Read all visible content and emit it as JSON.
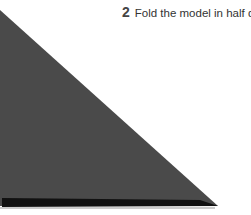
{
  "instruction": {
    "step_number": "2",
    "text": "Fold the model in half diagonally."
  },
  "diagram": {
    "shape": "folded-triangle",
    "paper_color": "#4a4a4a",
    "fold_edge_color": "#111111"
  }
}
